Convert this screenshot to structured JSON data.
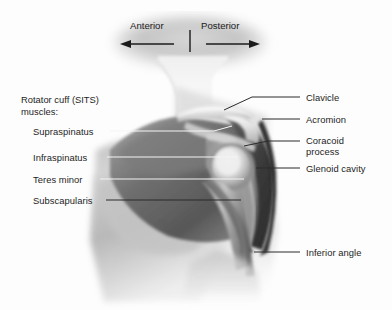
{
  "figure": {
    "background_color": "#fdfdfd",
    "label_color": "#1d1d1d",
    "leader_line_dark": "#262626",
    "leader_line_light": "#f2f2f2"
  },
  "orientation": {
    "anterior_label": "Anterior",
    "posterior_label": "Posterior",
    "anterior_arrow": "left-arrow-icon",
    "posterior_arrow": "right-arrow-icon",
    "divider": "vertical-divider"
  },
  "groups": {
    "rotator_cuff": {
      "title_line1": "Rotator cuff (SITS)",
      "title_line2": "muscles:",
      "items": [
        {
          "label": "Supraspinatus",
          "x": 33,
          "y": 128
        },
        {
          "label": "Infraspinatus",
          "x": 33,
          "y": 153
        },
        {
          "label": "Teres minor",
          "x": 33,
          "y": 175
        },
        {
          "label": "Subscapularis",
          "x": 33,
          "y": 196
        }
      ]
    }
  },
  "labels_right": [
    {
      "label": "Clavicle",
      "x": 306,
      "y": 93
    },
    {
      "label": "Acromion",
      "x": 306,
      "y": 115
    },
    {
      "label": "Coracoid",
      "label2": "process",
      "x": 306,
      "y": 136
    },
    {
      "label": "Glenoid cavity",
      "x": 306,
      "y": 164
    },
    {
      "label": "Inferior angle",
      "x": 306,
      "y": 248
    }
  ],
  "structures": [
    "neck",
    "trapezius",
    "deltoid",
    "thorax",
    "clavicle",
    "acromion",
    "coracoid-process",
    "glenoid-cavity",
    "humeral-head",
    "humerus-shaft",
    "scapula",
    "inferior-angle"
  ]
}
